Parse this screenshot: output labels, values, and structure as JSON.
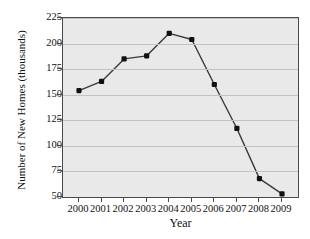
{
  "chart_data": {
    "type": "line",
    "title": "",
    "subtitle": "",
    "xlabel": "Year",
    "ylabel": "Number of New Homes (thousands)",
    "categories": [
      "2000",
      "2001",
      "2002",
      "2003",
      "2004",
      "2005",
      "2006",
      "2007",
      "2008",
      "2009"
    ],
    "values": [
      154,
      163,
      185,
      188,
      210,
      204,
      160,
      117,
      68,
      53
    ],
    "series": [
      {
        "name": "Number of New Homes",
        "values": [
          154,
          163,
          185,
          188,
          210,
          204,
          160,
          117,
          68,
          53
        ]
      }
    ],
    "x": [
      2000,
      2001,
      2002,
      2003,
      2004,
      2005,
      2006,
      2007,
      2008,
      2009
    ],
    "ylim": [
      50,
      225
    ],
    "xlim": [
      2000,
      2009
    ],
    "y_ticks": [
      50,
      75,
      100,
      125,
      150,
      175,
      200,
      225
    ],
    "y_tick_labels": [
      "50",
      "75",
      "100",
      "125",
      "150",
      "175",
      "200",
      "225"
    ],
    "x_ticks": [
      2000,
      2001,
      2002,
      2003,
      2004,
      2005,
      2006,
      2007,
      2008,
      2009
    ],
    "x_tick_labels": [
      "2000",
      "2001",
      "2002",
      "2003",
      "2004",
      "2005",
      "2006",
      "2007",
      "2008",
      "2009"
    ],
    "grid": "horizontal",
    "legend": "none",
    "annotations": [],
    "marker": "filled-square",
    "colors": {
      "line": "#3a3a3a",
      "marker": "#111111",
      "plot_background": "#e9e9e9",
      "gridline": "#c2c2c2",
      "axis": "#4a4a4a",
      "text": "#111111",
      "page_background": "#ffffff"
    }
  }
}
